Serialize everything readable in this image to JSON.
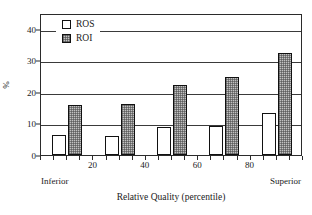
{
  "chart_data": {
    "type": "bar",
    "title": "",
    "xlabel": "Relative Quality (percentile)",
    "ylabel": "%",
    "categories": [
      10,
      30,
      50,
      70,
      90
    ],
    "series": [
      {
        "name": "ROS",
        "values": [
          6.2,
          6.0,
          8.8,
          9.2,
          13.3
        ]
      },
      {
        "name": "ROI",
        "values": [
          16.0,
          16.3,
          22.3,
          24.7,
          32.2
        ]
      }
    ],
    "xlim": [
      0,
      100
    ],
    "ylim": [
      0,
      45
    ],
    "yticks": [
      0,
      10,
      20,
      30,
      40
    ],
    "xticks": [
      20,
      40,
      60,
      80
    ],
    "grid": "horizontal",
    "legend_position": "top-left",
    "x_axis_end_labels": {
      "left": "Inferior",
      "right": "Superior"
    },
    "colors": {
      "ROS": "#ffffff",
      "ROI": "#c2c2c2",
      "outline": "#111111",
      "grid": "#3a3a3a"
    }
  },
  "legend": {
    "items": [
      {
        "label": "ROS",
        "style": "open"
      },
      {
        "label": "ROI",
        "style": "hatched"
      }
    ]
  },
  "axes": {
    "y_label": "%",
    "y_tick_labels": [
      "0",
      "10",
      "20",
      "30",
      "40"
    ],
    "x_tick_labels": [
      "20",
      "40",
      "60",
      "80"
    ],
    "x_title": "Relative Quality (percentile)",
    "x_left_end": "Inferior",
    "x_right_end": "Superior"
  }
}
